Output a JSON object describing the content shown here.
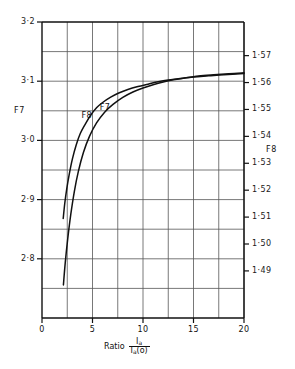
{
  "chart_data": {
    "type": "line",
    "title": "",
    "xlabel": "Ratio Ia / Ia(o)",
    "xlabel_prefix": "Ratio",
    "xlabel_numerator": "Ia",
    "xlabel_denominator": "Ia(o)",
    "ylabel_left": "F7",
    "ylabel_right": "F8",
    "xlim": [
      0,
      20
    ],
    "xticks": [
      0,
      5,
      10,
      15,
      20
    ],
    "xtick_labels": [
      "0",
      "5",
      "10",
      "15",
      "20"
    ],
    "xgrid_step": 2.5,
    "ylim_left": [
      2.7,
      3.2
    ],
    "yticks_left": [
      3.2,
      3.1,
      3.0,
      2.9,
      2.8
    ],
    "ytick_labels_left": [
      "3·2",
      "3·1",
      "3·0",
      "2·9",
      "2·8"
    ],
    "ylim_right": [
      1.4725,
      1.5825
    ],
    "yticks_right": [
      1.57,
      1.56,
      1.55,
      1.54,
      1.53,
      1.52,
      1.51,
      1.5,
      1.49
    ],
    "ytick_labels_right": [
      "1·57",
      "1·56",
      "1·55",
      "1·54",
      "1·53",
      "1·52",
      "1·51",
      "1·50",
      "1·49"
    ],
    "ygrid_step_left": 0.05,
    "grid": true,
    "legend": "inline-curve-labels",
    "annotations": [
      {
        "text": "F7",
        "x": 6.4,
        "y_left": 3.055
      },
      {
        "text": "F8",
        "x": 4.6,
        "y_right": 1.5475
      }
    ],
    "series": [
      {
        "name": "F7",
        "axis": "left",
        "label": "F7",
        "x": [
          2.1,
          2.25,
          2.45,
          2.7,
          3.0,
          3.4,
          3.8,
          4.3,
          4.8,
          5.4,
          6.0,
          6.8,
          7.6,
          8.5,
          9.5,
          10.5,
          11.5,
          12.5,
          13.5,
          15.0,
          16.5,
          18.0,
          20.0
        ],
        "values": [
          2.868,
          2.893,
          2.918,
          2.943,
          2.968,
          2.993,
          3.012,
          3.028,
          3.042,
          3.055,
          3.064,
          3.073,
          3.08,
          3.086,
          3.091,
          3.095,
          3.099,
          3.102,
          3.104,
          3.107,
          3.109,
          3.111,
          3.113
        ]
      },
      {
        "name": "F8",
        "axis": "right",
        "label": "F8",
        "x": [
          2.12,
          2.3,
          2.55,
          2.85,
          3.2,
          3.6,
          4.1,
          4.7,
          5.4,
          6.2,
          7.0,
          8.0,
          9.0,
          10.0,
          11.0,
          12.0,
          13.0,
          14.0,
          15.5,
          17.0,
          18.5,
          20.0
        ],
        "values": [
          1.4848,
          1.493,
          1.502,
          1.511,
          1.5195,
          1.527,
          1.534,
          1.54,
          1.545,
          1.549,
          1.5518,
          1.5545,
          1.5565,
          1.558,
          1.5592,
          1.5602,
          1.561,
          1.5616,
          1.5624,
          1.5629,
          1.5633,
          1.5636
        ]
      }
    ],
    "colors": {
      "curve": "#111111",
      "grid": "#555555",
      "axis": "#111111",
      "background": "#ffffff"
    }
  }
}
